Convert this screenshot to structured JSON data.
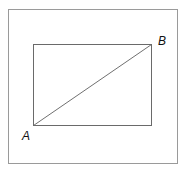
{
  "diagram": {
    "type": "rectangle-with-diagonal",
    "outer_frame": {
      "x": 8,
      "y": 9,
      "width": 170,
      "height": 155,
      "stroke": "#9a9a9a"
    },
    "rectangle": {
      "x": 33,
      "y": 44,
      "width": 119,
      "height": 82,
      "stroke": "#6a6a6a"
    },
    "diagonal": {
      "from": "A",
      "to": "B",
      "stroke": "#707070"
    },
    "points": {
      "A": {
        "label": "A",
        "x": 33,
        "y": 126
      },
      "B": {
        "label": "B",
        "x": 152,
        "y": 44
      }
    }
  }
}
